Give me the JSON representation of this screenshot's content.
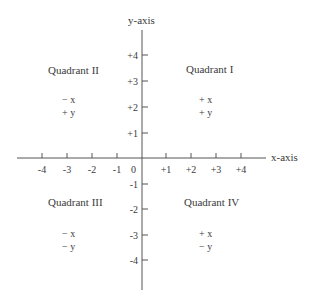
{
  "axes": {
    "x_label": "x-axis",
    "y_label": "y-axis",
    "origin_label": "0",
    "x_ticks": [
      "-4",
      "-3",
      "-2",
      "-1",
      "+1",
      "+2",
      "+3",
      "+4"
    ],
    "y_ticks": [
      "+4",
      "+3",
      "+2",
      "+1",
      "-1",
      "-2",
      "-3",
      "-4"
    ]
  },
  "quadrants": [
    {
      "name": "Quadrant I",
      "x_sign": "+ x",
      "y_sign": "+ y"
    },
    {
      "name": "Quadrant II",
      "x_sign": "− x",
      "y_sign": "+ y"
    },
    {
      "name": "Quadrant III",
      "x_sign": "− x",
      "y_sign": "− y"
    },
    {
      "name": "Quadrant IV",
      "x_sign": "+ x",
      "y_sign": "− y"
    }
  ],
  "colors": {
    "line": "#555555",
    "text": "#3a3a3a"
  }
}
